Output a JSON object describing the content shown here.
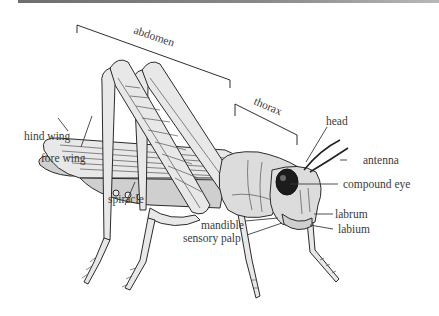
{
  "diagram": {
    "labels": {
      "abdomen": "abdomen",
      "thorax": "thorax",
      "head": "head",
      "antenna": "antenna",
      "compound_eye": "compound eye",
      "hind_wing": "hind wing",
      "fore_wing": "fore wing",
      "spiracle": "spiracle",
      "mandible": "mandible",
      "sensory_palp": "sensory palp",
      "labrum": "labrum",
      "labium": "labium"
    },
    "colors": {
      "label_text": "#3a3a3a",
      "body_fill": "#dcdcdc",
      "outline": "#2b2b2b",
      "eye": "#1c1c1c",
      "top_bar": "#7a7a7a"
    }
  }
}
